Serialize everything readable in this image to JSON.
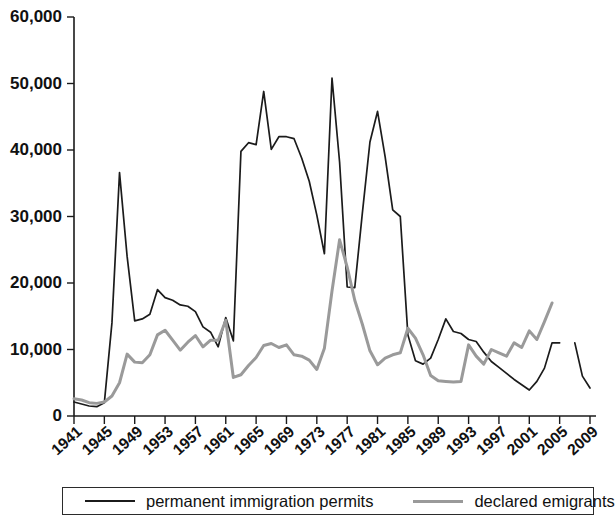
{
  "chart_data": {
    "type": "line",
    "title": "",
    "xlabel": "",
    "ylabel": "",
    "xlim": [
      1941,
      2009
    ],
    "ylim": [
      0,
      60000
    ],
    "grid": false,
    "legend_position": "bottom",
    "y_ticks": [
      0,
      10000,
      20000,
      30000,
      40000,
      50000,
      60000
    ],
    "y_tick_labels": [
      "0",
      "10,000",
      "20,000",
      "30,000",
      "40,000",
      "50,000",
      "60,000"
    ],
    "x_ticks": [
      1941,
      1945,
      1949,
      1953,
      1957,
      1961,
      1965,
      1969,
      1973,
      1977,
      1981,
      1985,
      1989,
      1993,
      1997,
      2001,
      2005,
      2009
    ],
    "x_tick_labels": [
      "1941",
      "1945",
      "1949",
      "1953",
      "1957",
      "1961",
      "1965",
      "1969",
      "1973",
      "1977",
      "1981",
      "1985",
      "1989",
      "1993",
      "1997",
      "2001",
      "2005",
      "2009"
    ],
    "x": [
      1941,
      1942,
      1943,
      1944,
      1945,
      1946,
      1947,
      1948,
      1949,
      1950,
      1951,
      1952,
      1953,
      1954,
      1955,
      1956,
      1957,
      1958,
      1959,
      1960,
      1961,
      1962,
      1963,
      1964,
      1965,
      1966,
      1967,
      1968,
      1969,
      1970,
      1971,
      1972,
      1973,
      1974,
      1975,
      1976,
      1977,
      1978,
      1979,
      1980,
      1981,
      1982,
      1983,
      1984,
      1985,
      1986,
      1987,
      1988,
      1989,
      1990,
      1991,
      1992,
      1993,
      1994,
      1995,
      1996,
      1997,
      1998,
      1999,
      2000,
      2001,
      2002,
      2003,
      2004,
      2005,
      2006,
      2007,
      2008,
      2009
    ],
    "series": [
      {
        "name": "permanent immigration permits",
        "color": "#1b1b1b",
        "style": "solid-thin",
        "values": [
          2100,
          1800,
          1500,
          1400,
          2000,
          14000,
          36600,
          24000,
          14300,
          14600,
          15300,
          19000,
          17800,
          17400,
          16700,
          16500,
          15700,
          13400,
          12600,
          10400,
          14800,
          11300,
          39800,
          41100,
          40800,
          48800,
          40100,
          42000,
          42000,
          41700,
          38800,
          35300,
          30200,
          24400,
          50800,
          38200,
          19400,
          19300,
          30500,
          41200,
          45800,
          39000,
          31000,
          30000,
          12200,
          8300,
          7800,
          8700,
          11500,
          14600,
          12700,
          12400,
          11500,
          11200,
          9600,
          8200,
          7300,
          6400,
          5500,
          4700,
          3900,
          5200,
          7200,
          11000,
          11000,
          null,
          11000,
          6000,
          4200
        ]
      },
      {
        "name": "declared emigrants",
        "color": "#9a9a9a",
        "style": "solid-thick",
        "values": [
          2600,
          2400,
          2000,
          1900,
          2100,
          3000,
          5000,
          9300,
          8100,
          8000,
          9200,
          12200,
          12900,
          11400,
          9900,
          11100,
          12100,
          10400,
          11400,
          11400,
          14400,
          5800,
          6200,
          7600,
          8800,
          10600,
          10900,
          10300,
          10700,
          9200,
          9000,
          8400,
          7000,
          10200,
          18800,
          26500,
          22400,
          17400,
          13800,
          9800,
          7700,
          8700,
          9200,
          9500,
          13200,
          11700,
          9200,
          6100,
          5300,
          5200,
          5100,
          5200,
          10700,
          9000,
          7800,
          10000,
          9500,
          9000,
          11000,
          10300,
          12800,
          11500,
          14200,
          17000,
          null,
          null,
          null,
          null,
          null
        ]
      }
    ]
  },
  "legend": {
    "items": [
      {
        "label": "permanent immigration permits",
        "color": "#1b1b1b"
      },
      {
        "label": "declared emigrants",
        "color": "#9a9a9a"
      }
    ]
  }
}
